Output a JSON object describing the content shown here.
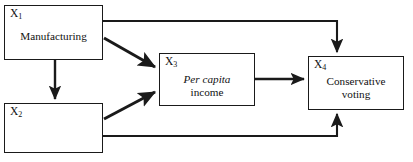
{
  "diagram": {
    "type": "path-model",
    "nodes": [
      {
        "id": "x1",
        "variable": "X",
        "subscript": "1",
        "label": "Manufacturing",
        "label_italic": "",
        "label_second_line": ""
      },
      {
        "id": "x2",
        "variable": "X",
        "subscript": "2",
        "label": "Nonconformity",
        "label_italic": "",
        "label_second_line": ""
      },
      {
        "id": "x3",
        "variable": "X",
        "subscript": "3",
        "label": "",
        "label_italic": "Per capita",
        "label_second_line": "income"
      },
      {
        "id": "x4",
        "variable": "X",
        "subscript": "4",
        "label": "Conservative",
        "label_italic": "",
        "label_second_line": "voting"
      }
    ],
    "edges": [
      {
        "id": "x1-to-x4",
        "from": "X1",
        "to": "X4",
        "route": "orthogonal-top"
      },
      {
        "id": "x1-to-x3",
        "from": "X1",
        "to": "X3",
        "route": "diagonal-down"
      },
      {
        "id": "x1-to-x2",
        "from": "X1",
        "to": "X2",
        "route": "vertical-down"
      },
      {
        "id": "x2-to-x3",
        "from": "X2",
        "to": "X3",
        "route": "diagonal-up"
      },
      {
        "id": "x2-to-x4",
        "from": "X2",
        "to": "X4",
        "route": "orthogonal-bottom"
      },
      {
        "id": "x3-to-x4",
        "from": "X3",
        "to": "X4",
        "route": "horizontal"
      }
    ],
    "colors": {
      "stroke": "#1a1a1a",
      "text": "#111111",
      "background": "#ffffff"
    }
  }
}
